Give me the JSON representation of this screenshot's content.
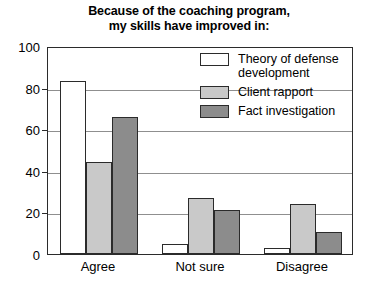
{
  "chart_data": {
    "type": "bar",
    "title": "Because of the coaching program, my skills have improved in:",
    "title_line1": "Because of the coaching program,",
    "title_line2": "my skills have improved in:",
    "xlabel": "",
    "ylabel": "",
    "ylim": [
      0,
      100
    ],
    "yticks": [
      0,
      20,
      40,
      60,
      80,
      100
    ],
    "ytick_labels": [
      "0",
      "20",
      "40",
      "60",
      "80",
      "100"
    ],
    "grid": true,
    "legend_position": "upper right",
    "categories": [
      "Agree",
      "Not sure",
      "Disagree"
    ],
    "series": [
      {
        "name": "Theory of defense development",
        "color": "#ffffff",
        "values": [
          83,
          5,
          3
        ]
      },
      {
        "name": "Client rapport",
        "color": "#c9c9c9",
        "values": [
          44,
          27,
          24
        ]
      },
      {
        "name": "Fact investigation",
        "color": "#8c8c8c",
        "values": [
          66,
          21,
          10.5
        ]
      }
    ]
  },
  "style": {
    "axis_color": "#2b2b2b",
    "grid_color": "#8f8f8f",
    "background": "#ffffff"
  }
}
